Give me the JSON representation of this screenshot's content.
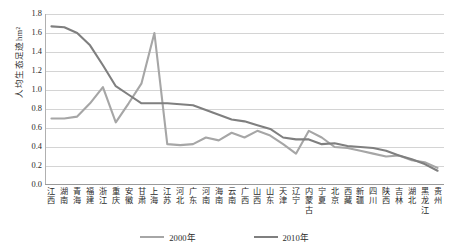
{
  "chart_data": {
    "type": "line",
    "title": "",
    "xlabel": "",
    "ylabel": "人均生态足迹hm²",
    "ylim": [
      0.0,
      1.8
    ],
    "yticks": [
      "1.8",
      "1.6",
      "1.4",
      "1.2",
      "1.0",
      "0.8",
      "0.6",
      "0.4",
      "0.2",
      "0.0"
    ],
    "ytick_values": [
      1.8,
      1.6,
      1.4,
      1.2,
      1.0,
      0.8,
      0.6,
      0.4,
      0.2,
      0.0
    ],
    "grid": true,
    "legend_position": "bottom-center",
    "categories": [
      "江西",
      "湖南",
      "青海",
      "福建",
      "浙江",
      "重庆",
      "安徽",
      "甘肃",
      "上海",
      "江苏",
      "河北",
      "广东",
      "河南",
      "海南",
      "云南",
      "广西",
      "山西",
      "山东",
      "天津",
      "辽宁",
      "内蒙古",
      "宁夏",
      "北京",
      "西藏",
      "新疆",
      "四川",
      "陕西",
      "吉林",
      "湖北",
      "黑龙江",
      "贵州"
    ],
    "series": [
      {
        "name": "2000年",
        "color": "#a6a6a6",
        "values": [
          0.7,
          0.7,
          0.72,
          0.86,
          1.03,
          0.66,
          0.86,
          1.07,
          1.6,
          0.43,
          0.42,
          0.43,
          0.5,
          0.47,
          0.55,
          0.5,
          0.57,
          0.52,
          0.43,
          0.33,
          0.57,
          0.5,
          0.4,
          0.39,
          0.36,
          0.33,
          0.3,
          0.31,
          0.26,
          0.24,
          0.18
        ]
      },
      {
        "name": "2010年",
        "color": "#7f7f7f",
        "values": [
          1.67,
          1.66,
          1.6,
          1.47,
          1.26,
          1.04,
          0.95,
          0.86,
          0.86,
          0.86,
          0.85,
          0.84,
          0.79,
          0.74,
          0.69,
          0.67,
          0.63,
          0.59,
          0.5,
          0.48,
          0.48,
          0.43,
          0.44,
          0.41,
          0.4,
          0.39,
          0.36,
          0.31,
          0.27,
          0.22,
          0.15
        ]
      }
    ]
  },
  "legend": {
    "items": [
      {
        "label": "2000年",
        "color": "#a6a6a6"
      },
      {
        "label": "2010年",
        "color": "#7f7f7f"
      }
    ]
  }
}
